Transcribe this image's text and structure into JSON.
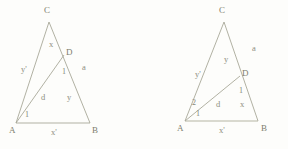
{
  "figure": {
    "stroke_color": "#a8a898",
    "label_color": "#8a8a7a",
    "background_color": "#fdfdfb",
    "diagrams": [
      {
        "id": "left-triangle",
        "vertices": {
          "A": {
            "label": "A",
            "x": 16,
            "y": 123
          },
          "B": {
            "label": "B",
            "x": 90,
            "y": 123
          },
          "C": {
            "label": "C",
            "x": 49,
            "y": 22
          },
          "D": {
            "label": "D",
            "x": 64,
            "y": 55
          }
        },
        "labels": {
          "side_ac": "y'",
          "seg_cd": "x",
          "seg_db": "y",
          "side_cb_outer": "a",
          "cevian_ad": "d",
          "base_ab": "x'",
          "angle_at_d": "1",
          "angle_at_a": "1"
        }
      },
      {
        "id": "right-triangle",
        "vertices": {
          "A": {
            "label": "A",
            "x": 185,
            "y": 121
          },
          "B": {
            "label": "B",
            "x": 258,
            "y": 121
          },
          "C": {
            "label": "C",
            "x": 224,
            "y": 22
          },
          "D": {
            "label": "D",
            "x": 240,
            "y": 76
          }
        },
        "labels": {
          "side_ac": "y'",
          "seg_cd": "y",
          "seg_db": "x",
          "side_cb_outer": "a",
          "cevian_ad": "d",
          "base_ab": "x'",
          "angle_at_d": "1",
          "angle_at_a_upper": "2",
          "angle_at_a_lower": "1"
        }
      }
    ]
  }
}
